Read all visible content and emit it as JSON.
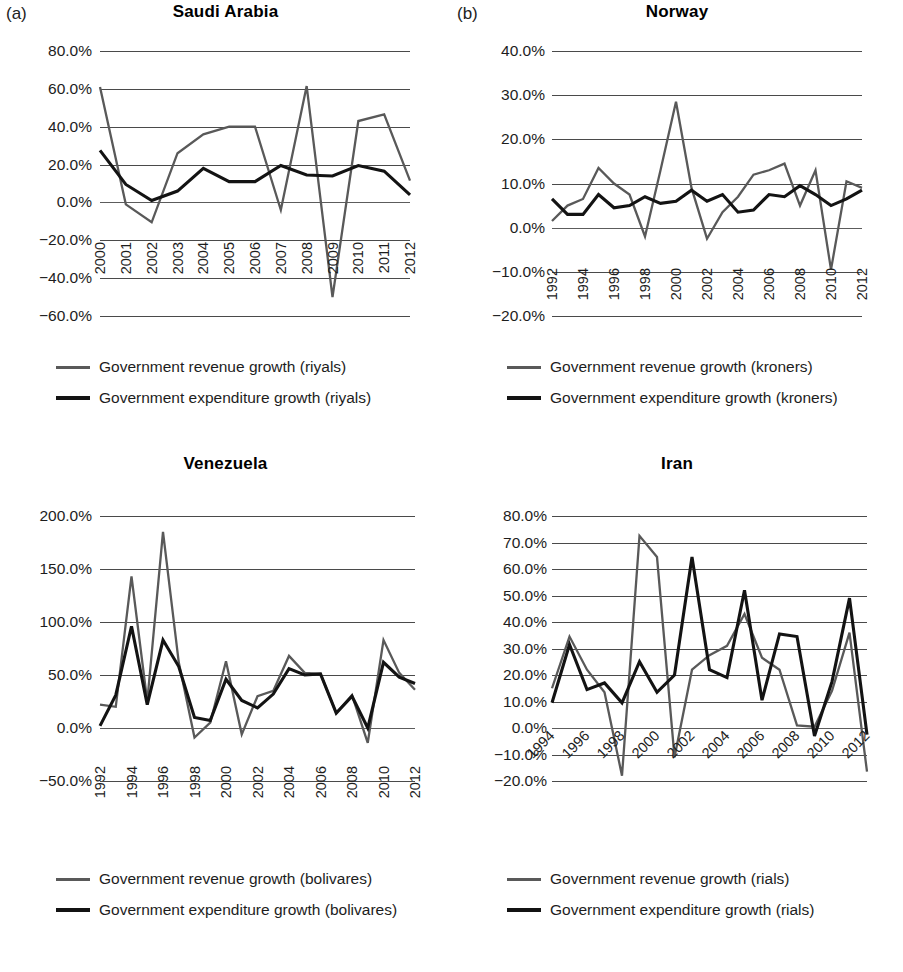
{
  "figure": {
    "panels": [
      {
        "letter": "(a)",
        "title": "Saudi Arabia",
        "legend": [
          {
            "label": "Government revenue growth (riyals)",
            "style": "rev"
          },
          {
            "label": "Government expenditure growth (riyals)",
            "style": "exp"
          }
        ]
      },
      {
        "letter": "(b)",
        "title": "Norway",
        "legend": [
          {
            "label": "Government revenue growth (kroners)",
            "style": "rev"
          },
          {
            "label": "Government expenditure growth (kroners)",
            "style": "exp"
          }
        ]
      },
      {
        "letter": "",
        "title": "Venezuela",
        "legend": [
          {
            "label": "Government revenue growth (bolivares)",
            "style": "rev"
          },
          {
            "label": "Government expenditure growth (bolivares)",
            "style": "exp"
          }
        ]
      },
      {
        "letter": "",
        "title": "Iran",
        "legend": [
          {
            "label": "Government revenue growth (rials)",
            "style": "rev"
          },
          {
            "label": "Government expenditure growth (rials)",
            "style": "exp"
          }
        ]
      }
    ]
  },
  "colors": {
    "revenue": "#595959",
    "expenditure": "#131313",
    "gridline": "#4a4a4a",
    "text": "#1d1d1d",
    "background": "#ffffff"
  },
  "chart_data": [
    {
      "type": "line",
      "panel": "(a)",
      "title": "Saudi Arabia",
      "xlabel": "",
      "ylabel": "",
      "grid": true,
      "legend_position": "below",
      "x": [
        2000,
        2001,
        2002,
        2003,
        2004,
        2005,
        2006,
        2007,
        2008,
        2009,
        2010,
        2011,
        2012
      ],
      "xtick_labels": [
        "2000",
        "2001",
        "2002",
        "2003",
        "2004",
        "2005",
        "2006",
        "2007",
        "2008",
        "2009",
        "2010",
        "2011",
        "2012"
      ],
      "ytick_labels": [
        "80.0%",
        "60.0%",
        "40.0%",
        "20.0%",
        "0.0%",
        "-20.0%",
        "-40.0%",
        "-60.0%"
      ],
      "yticks": [
        80,
        60,
        40,
        20,
        0,
        -20,
        -40,
        -60
      ],
      "ylim": [
        -60,
        80
      ],
      "series": [
        {
          "name": "Government revenue growth (riyals)",
          "color": "#595959",
          "values": [
            61.0,
            -1.0,
            -10.5,
            26.0,
            36.0,
            40.0,
            40.0,
            -4.0,
            61.5,
            -50.0,
            43.0,
            46.5,
            11.5
          ]
        },
        {
          "name": "Government expenditure growth (riyals)",
          "color": "#131313",
          "values": [
            27.5,
            9.5,
            1.0,
            6.0,
            18.0,
            11.0,
            11.0,
            19.5,
            14.5,
            14.0,
            19.5,
            16.5,
            4.0
          ]
        }
      ]
    },
    {
      "type": "line",
      "panel": "(b)",
      "title": "Norway",
      "xlabel": "",
      "ylabel": "",
      "grid": true,
      "legend_position": "below",
      "x": [
        1992,
        1993,
        1994,
        1995,
        1996,
        1997,
        1998,
        1999,
        2000,
        2001,
        2002,
        2003,
        2004,
        2005,
        2006,
        2007,
        2008,
        2009,
        2010,
        2011,
        2012
      ],
      "xtick_labels": [
        "1992",
        "1994",
        "1996",
        "1998",
        "2000",
        "2002",
        "2004",
        "2006",
        "2008",
        "2010",
        "2012"
      ],
      "ytick_labels": [
        "40.0%",
        "30.0%",
        "20.0%",
        "10.0%",
        "0.0%",
        "-10.0%",
        "-20.0%"
      ],
      "yticks": [
        40,
        30,
        20,
        10,
        0,
        -10,
        -20
      ],
      "ylim": [
        -20,
        40
      ],
      "series": [
        {
          "name": "Government revenue growth (kroners)",
          "color": "#595959",
          "values": [
            1.5,
            5.0,
            6.5,
            13.5,
            10.0,
            7.5,
            -2.0,
            13.0,
            28.5,
            9.0,
            -2.5,
            3.5,
            7.0,
            12.0,
            13.0,
            14.5,
            5.0,
            13.0,
            -9.5,
            10.5,
            9.0
          ]
        },
        {
          "name": "Government expenditure growth (kroners)",
          "color": "#131313",
          "values": [
            6.5,
            3.0,
            3.0,
            7.5,
            4.5,
            5.0,
            7.0,
            5.5,
            6.0,
            8.5,
            6.0,
            7.5,
            3.5,
            4.0,
            7.5,
            7.0,
            9.5,
            7.5,
            5.0,
            6.5,
            8.5
          ]
        }
      ]
    },
    {
      "type": "line",
      "panel": "",
      "title": "Venezuela",
      "xlabel": "",
      "ylabel": "",
      "grid": true,
      "legend_position": "below",
      "x": [
        1992,
        1993,
        1994,
        1995,
        1996,
        1997,
        1998,
        1999,
        2000,
        2001,
        2002,
        2003,
        2004,
        2005,
        2006,
        2007,
        2008,
        2009,
        2010,
        2011,
        2012
      ],
      "xtick_labels": [
        "1992",
        "1994",
        "1996",
        "1998",
        "2000",
        "2002",
        "2004",
        "2006",
        "2008",
        "2010",
        "2012"
      ],
      "ytick_labels": [
        "200.0%",
        "150.0%",
        "100.0%",
        "50.0%",
        "0.0%",
        "-50.0%"
      ],
      "yticks": [
        200,
        150,
        100,
        50,
        0,
        -50
      ],
      "ylim": [
        -50,
        200
      ],
      "series": [
        {
          "name": "Government revenue growth (bolivares)",
          "color": "#595959",
          "values": [
            22.0,
            20.0,
            143.0,
            25.0,
            185.0,
            62.0,
            -9.0,
            5.0,
            63.0,
            -6.0,
            30.0,
            35.0,
            68.0,
            52.0,
            51.0,
            14.0,
            31.0,
            -14.0,
            83.0,
            52.0,
            36.0
          ]
        },
        {
          "name": "Government expenditure growth (bolivares)",
          "color": "#131313",
          "values": [
            2.0,
            31.0,
            96.0,
            22.0,
            83.0,
            58.0,
            10.0,
            7.0,
            46.0,
            26.0,
            19.0,
            32.0,
            56.0,
            50.0,
            51.0,
            14.0,
            30.0,
            0.0,
            62.0,
            48.0,
            42.0
          ]
        }
      ]
    },
    {
      "type": "line",
      "panel": "",
      "title": "Iran",
      "xlabel": "",
      "ylabel": "",
      "grid": true,
      "legend_position": "below",
      "x": [
        1994,
        1995,
        1996,
        1997,
        1998,
        1999,
        2000,
        2001,
        2002,
        2003,
        2004,
        2005,
        2006,
        2007,
        2008,
        2009,
        2010,
        2011,
        2012
      ],
      "xtick_labels": [
        "1994",
        "1996",
        "1998",
        "2000",
        "2002",
        "2004",
        "2006",
        "2008",
        "2010",
        "2012"
      ],
      "ytick_labels": [
        "80.0%",
        "70.0%",
        "60.0%",
        "50.0%",
        "40.0%",
        "30.0%",
        "20.0%",
        "10.0%",
        "0.0%",
        "-10.0%",
        "-20.0%"
      ],
      "yticks": [
        80,
        70,
        60,
        50,
        40,
        30,
        20,
        10,
        0,
        -10,
        -20
      ],
      "ylim": [
        -20,
        80
      ],
      "series": [
        {
          "name": "Government revenue growth (rials)",
          "color": "#595959",
          "values": [
            15.0,
            34.5,
            22.0,
            13.5,
            -18.0,
            72.5,
            64.5,
            -11.0,
            22.0,
            27.5,
            31.0,
            43.0,
            26.5,
            22.0,
            1.0,
            0.5,
            14.0,
            36.0,
            -16.5
          ]
        },
        {
          "name": "Government expenditure growth (rials)",
          "color": "#131313",
          "values": [
            9.5,
            31.5,
            14.5,
            17.0,
            9.5,
            25.0,
            13.5,
            20.0,
            64.5,
            22.0,
            19.0,
            52.0,
            10.5,
            35.5,
            34.5,
            -3.0,
            17.5,
            49.0,
            -2.5
          ]
        }
      ]
    }
  ]
}
